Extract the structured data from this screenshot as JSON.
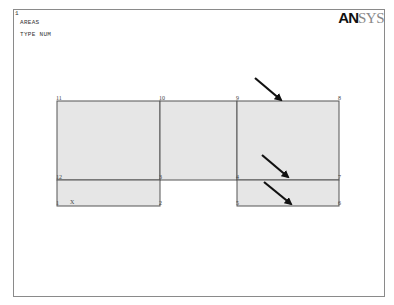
{
  "window": {
    "number": "1",
    "title": "AREAS",
    "subtitle": "TYPE NUM"
  },
  "logo": {
    "bold": "AN",
    "light": "SYS"
  },
  "plot": {
    "fill_color": "#e6e6e6",
    "line_color": "#555555",
    "areas": [
      {
        "id": "area-left-upper",
        "x1": 57,
        "y1": 101,
        "x2": 160,
        "y2": 180
      },
      {
        "id": "area-mid-upper",
        "x1": 160,
        "y1": 101,
        "x2": 237,
        "y2": 180
      },
      {
        "id": "area-right-upper",
        "x1": 237,
        "y1": 101,
        "x2": 339,
        "y2": 180
      },
      {
        "id": "area-left-lower",
        "x1": 57,
        "y1": 180,
        "x2": 160,
        "y2": 206
      },
      {
        "id": "area-right-lower",
        "x1": 237,
        "y1": 180,
        "x2": 339,
        "y2": 206
      }
    ],
    "nodes": [
      {
        "label": "11",
        "x": 57,
        "y": 101
      },
      {
        "label": "10",
        "x": 160,
        "y": 101
      },
      {
        "label": "9",
        "x": 237,
        "y": 101
      },
      {
        "label": "8",
        "x": 339,
        "y": 101
      },
      {
        "label": "12",
        "x": 57,
        "y": 180
      },
      {
        "label": "3",
        "x": 160,
        "y": 180
      },
      {
        "label": "4",
        "x": 237,
        "y": 180
      },
      {
        "label": "7",
        "x": 339,
        "y": 180
      },
      {
        "label": "1",
        "x": 57,
        "y": 206
      },
      {
        "label": "2",
        "x": 160,
        "y": 206
      },
      {
        "label": "5",
        "x": 237,
        "y": 206
      },
      {
        "label": "6",
        "x": 339,
        "y": 206
      }
    ],
    "axis_label": "X",
    "arrows": [
      {
        "x1": 255,
        "y1": 78,
        "x2": 281,
        "y2": 100
      },
      {
        "x1": 262,
        "y1": 155,
        "x2": 288,
        "y2": 177
      },
      {
        "x1": 264,
        "y1": 182,
        "x2": 291,
        "y2": 204
      }
    ]
  }
}
